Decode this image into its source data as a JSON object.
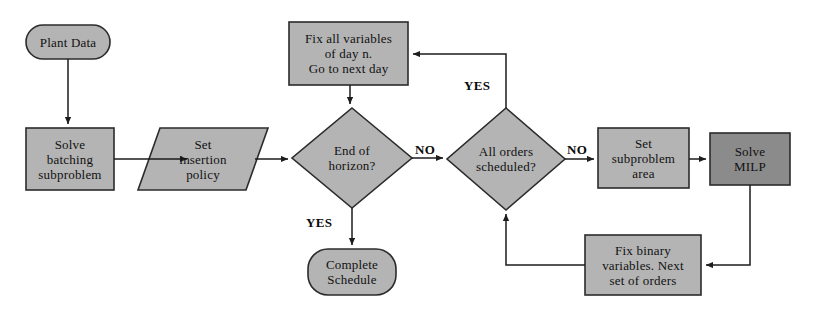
{
  "diagram": {
    "colors": {
      "fill_light": "#b4b4b4",
      "fill_dark": "#8b8b8b",
      "stroke": "#2b2b2b",
      "background": "#ffffff",
      "text": "#111111"
    },
    "nodes": [
      {
        "id": "plant-data",
        "shape": "rounded-rectangle",
        "label": "Plant Data",
        "fill": "#b4b4b4",
        "x": 26,
        "y": 25,
        "w": 84,
        "h": 34
      },
      {
        "id": "solve-batching-subproblem",
        "shape": "rectangle",
        "label": "Solve\nbatching\nsubproblem",
        "fill": "#b4b4b4",
        "x": 26,
        "y": 128,
        "w": 88,
        "h": 62
      },
      {
        "id": "set-insertion-policy",
        "shape": "parallelogram",
        "label": "Set\ninsertion\npolicy",
        "fill": "#b4b4b4",
        "x": 138,
        "y": 128,
        "w": 130,
        "h": 62
      },
      {
        "id": "fix-all-variables",
        "shape": "rectangle",
        "label": "Fix all variables\nof day n.\nGo to next day",
        "fill": "#b4b4b4",
        "x": 289,
        "y": 22,
        "w": 119,
        "h": 63
      },
      {
        "id": "end-of-horizon",
        "shape": "diamond",
        "label": "End of\nhorizon?",
        "fill": "#b4b4b4",
        "x": 292,
        "y": 108,
        "w": 120,
        "h": 100
      },
      {
        "id": "complete-schedule",
        "shape": "rounded-rectangle",
        "label": "Complete\nSchedule",
        "fill": "#b4b4b4",
        "x": 308,
        "y": 249,
        "w": 88,
        "h": 46
      },
      {
        "id": "all-orders-scheduled",
        "shape": "diamond",
        "label": "All orders\nscheduled?",
        "fill": "#b4b4b4",
        "x": 447,
        "y": 108,
        "w": 118,
        "h": 102
      },
      {
        "id": "set-subproblem-area",
        "shape": "rectangle",
        "label": "Set\nsubproblem\narea",
        "fill": "#b4b4b4",
        "x": 598,
        "y": 128,
        "w": 91,
        "h": 60
      },
      {
        "id": "solve-milp",
        "shape": "rectangle",
        "label": "Solve\nMILP",
        "fill": "#8b8b8b",
        "x": 710,
        "y": 133,
        "w": 80,
        "h": 52
      },
      {
        "id": "fix-binary-variables",
        "shape": "rectangle",
        "label": "Fix binary\nvariables. Next\nset of orders",
        "fill": "#b4b4b4",
        "x": 585,
        "y": 235,
        "w": 116,
        "h": 60
      }
    ],
    "edge_labels": [
      {
        "id": "yes-end-of-horizon",
        "text": "YES",
        "x": 306,
        "y": 215
      },
      {
        "id": "no-end-of-horizon",
        "text": "NO",
        "x": 415,
        "y": 142
      },
      {
        "id": "yes-all-orders",
        "text": "YES",
        "x": 464,
        "y": 78
      },
      {
        "id": "no-all-orders",
        "text": "NO",
        "x": 567,
        "y": 142
      }
    ],
    "edges": [
      {
        "id": "plant-data-to-solve-batching",
        "from": "plant-data",
        "to": "solve-batching-subproblem"
      },
      {
        "id": "solve-batching-to-set-insertion",
        "from": "solve-batching-subproblem",
        "to": "set-insertion-policy"
      },
      {
        "id": "set-insertion-to-end-of-horizon",
        "from": "set-insertion-policy",
        "to": "end-of-horizon"
      },
      {
        "id": "fix-all-variables-to-end-of-horizon",
        "from": "fix-all-variables",
        "to": "end-of-horizon"
      },
      {
        "id": "end-of-horizon-yes-to-complete-schedule",
        "from": "end-of-horizon",
        "to": "complete-schedule",
        "label": "YES"
      },
      {
        "id": "end-of-horizon-no-to-all-orders",
        "from": "end-of-horizon",
        "to": "all-orders-scheduled",
        "label": "NO"
      },
      {
        "id": "all-orders-yes-to-fix-all-variables",
        "from": "all-orders-scheduled",
        "to": "fix-all-variables",
        "label": "YES"
      },
      {
        "id": "all-orders-no-to-set-subproblem",
        "from": "all-orders-scheduled",
        "to": "set-subproblem-area",
        "label": "NO"
      },
      {
        "id": "set-subproblem-to-solve-milp",
        "from": "set-subproblem-area",
        "to": "solve-milp"
      },
      {
        "id": "solve-milp-to-fix-binary",
        "from": "solve-milp",
        "to": "fix-binary-variables"
      },
      {
        "id": "fix-binary-to-all-orders",
        "from": "fix-binary-variables",
        "to": "all-orders-scheduled"
      }
    ]
  }
}
